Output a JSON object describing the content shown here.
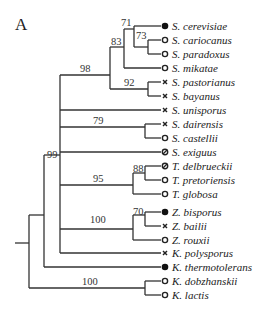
{
  "panel_label": "A",
  "legend_symbols": {
    "filled": "filled-circle",
    "open": "open-circle",
    "cross": "cross",
    "slashed": "slashed-circle"
  },
  "taxa": [
    {
      "name": "S. cerevisiae",
      "symbol": "filled"
    },
    {
      "name": "S. cariocanus",
      "symbol": "open"
    },
    {
      "name": "S. paradoxus",
      "symbol": "open"
    },
    {
      "name": "S. mikatae",
      "symbol": "open"
    },
    {
      "name": "S. pastorianus",
      "symbol": "cross"
    },
    {
      "name": "S. bayanus",
      "symbol": "cross"
    },
    {
      "name": "S. unisporus",
      "symbol": "cross"
    },
    {
      "name": "S. dairensis",
      "symbol": "cross"
    },
    {
      "name": "S. castellii",
      "symbol": "open"
    },
    {
      "name": "S. exiguus",
      "symbol": "slashed"
    },
    {
      "name": "T. delbrueckii",
      "symbol": "slashed"
    },
    {
      "name": "T. pretoriensis",
      "symbol": "open"
    },
    {
      "name": "T. globosa",
      "symbol": "open"
    },
    {
      "name": "Z. bisporus",
      "symbol": "filled"
    },
    {
      "name": "Z. bailii",
      "symbol": "cross"
    },
    {
      "name": "Z. rouxii",
      "symbol": "open"
    },
    {
      "name": "K. polysporus",
      "symbol": "cross"
    },
    {
      "name": "K. thermotolerans",
      "symbol": "filled"
    },
    {
      "name": "K. dobzhanskii",
      "symbol": "open"
    },
    {
      "name": "K. lactis",
      "symbol": "open"
    }
  ],
  "bootstrap": {
    "cer_car_par": "71",
    "car_par": "73",
    "sensu_stricto": "83",
    "sensu_stricto_plus": "98",
    "pas_bay": "92",
    "dai_cas": "79",
    "main_clade": "99",
    "tor_del_pre": "88",
    "torulaspora": "95",
    "zygo_bis_bai": "70",
    "zygosaccharomyces": "100",
    "kluyveromyces": "100"
  }
}
